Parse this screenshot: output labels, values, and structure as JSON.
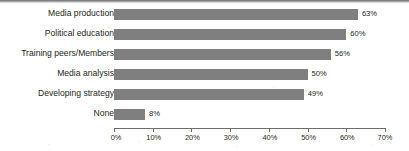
{
  "chart_data": {
    "type": "bar",
    "orientation": "horizontal",
    "title": "",
    "subtitle": "",
    "xlabel": "",
    "ylabel": "",
    "categories": [
      "Media production",
      "Political education",
      "Training peers/Members",
      "Media analysis",
      "Developing strategy",
      "None"
    ],
    "values": [
      63,
      60,
      56,
      50,
      49,
      8
    ],
    "value_labels": [
      "63%",
      "60%",
      "56%",
      "50%",
      "49%",
      "8%"
    ],
    "xlim": [
      0,
      70
    ],
    "xticks": [
      0,
      10,
      20,
      30,
      40,
      50,
      60,
      70
    ],
    "xtick_labels": [
      "0%",
      "10%",
      "20%",
      "30%",
      "40%",
      "50%",
      "60%",
      "70%"
    ],
    "grid": false,
    "legend": false,
    "legend_position": "none",
    "bar_color": "#7F7F7F",
    "axis_color": "#6D6D6D",
    "text_color": "#231F20",
    "background_color": "#FFFFFF"
  }
}
